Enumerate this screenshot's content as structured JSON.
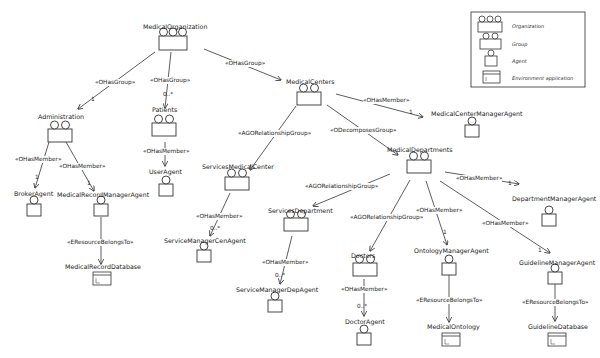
{
  "diagram": {
    "legend": {
      "items": [
        {
          "icon": "organization-icon",
          "label": "Organization"
        },
        {
          "icon": "group-icon",
          "label": "Group"
        },
        {
          "icon": "agent-icon",
          "label": "Agent"
        },
        {
          "icon": "environment-application-icon",
          "label": "Environment application"
        }
      ]
    },
    "nodes": [
      {
        "id": "MedicalOrganization",
        "label": "MedicalOrganization",
        "type": "organization"
      },
      {
        "id": "Administration",
        "label": "Administration",
        "type": "group"
      },
      {
        "id": "Patients",
        "label": "Patients",
        "type": "group"
      },
      {
        "id": "MedicalCenters",
        "label": "MedicalCenters",
        "type": "group"
      },
      {
        "id": "BrokerAgent",
        "label": "BrokerAgent",
        "type": "agent"
      },
      {
        "id": "MedicalRecordManagerAgent",
        "label": "MedicalRecordManagerAgent",
        "type": "agent"
      },
      {
        "id": "UserAgent",
        "label": "UserAgent",
        "type": "agent"
      },
      {
        "id": "MedicalRecordDatabase",
        "label": "MedicalRecordDatabase",
        "type": "environment"
      },
      {
        "id": "MedicalCenterManagerAgent",
        "label": "MedicalCenterManagerAgent",
        "type": "agent"
      },
      {
        "id": "ServicesMedicalCenter",
        "label": "ServicesMedicalCenter",
        "type": "group"
      },
      {
        "id": "ServiceManagerCenAgent",
        "label": "ServiceManagerCenAgent",
        "type": "agent"
      },
      {
        "id": "MedicalDepartments",
        "label": "MedicalDepartments",
        "type": "group"
      },
      {
        "id": "DepartmentManagerAgent",
        "label": "DepartmentManagerAgent",
        "type": "agent"
      },
      {
        "id": "ServicesDepartment",
        "label": "ServicesDepartment",
        "type": "group"
      },
      {
        "id": "ServiceManagerDepAgent",
        "label": "ServiceManagerDepAgent",
        "type": "agent"
      },
      {
        "id": "Doctors",
        "label": "Doctors",
        "type": "group"
      },
      {
        "id": "DoctorAgent",
        "label": "DoctorAgent",
        "type": "agent"
      },
      {
        "id": "OntologyManagerAgent",
        "label": "OntologyManagerAgent",
        "type": "agent"
      },
      {
        "id": "MedicalOntology",
        "label": "MedicalOntology",
        "type": "environment"
      },
      {
        "id": "GuidelineManagerAgent",
        "label": "GuidelineManagerAgent",
        "type": "agent"
      },
      {
        "id": "GuidelineDatabase",
        "label": "GuidelineDatabase",
        "type": "environment"
      }
    ],
    "edges": [
      {
        "from": "MedicalOrganization",
        "to": "Administration",
        "label": "«OHasGroup»",
        "mult": "1"
      },
      {
        "from": "MedicalOrganization",
        "to": "Patients",
        "label": "«OHasGroup»",
        "mult": "0..*"
      },
      {
        "from": "MedicalOrganization",
        "to": "MedicalCenters",
        "label": "«OHasGroup»",
        "mult": ""
      },
      {
        "from": "Administration",
        "to": "BrokerAgent",
        "label": "«OHasMember»",
        "mult": "1"
      },
      {
        "from": "Administration",
        "to": "MedicalRecordManagerAgent",
        "label": "«OHasMember»",
        "mult": "1"
      },
      {
        "from": "Patients",
        "to": "UserAgent",
        "label": "«OHasMember»",
        "mult": ""
      },
      {
        "from": "MedicalRecordManagerAgent",
        "to": "MedicalRecordDatabase",
        "label": "«EResourceBelongsTo»",
        "mult": ""
      },
      {
        "from": "MedicalCenters",
        "to": "MedicalCenterManagerAgent",
        "label": "«OHasMember»",
        "mult": "1"
      },
      {
        "from": "MedicalCenters",
        "to": "ServicesMedicalCenter",
        "label": "«AGORelationshipGroup»",
        "mult": ""
      },
      {
        "from": "MedicalCenters",
        "to": "MedicalDepartments",
        "label": "«ODecomposesGroup»",
        "mult": ""
      },
      {
        "from": "ServicesMedicalCenter",
        "to": "ServiceManagerCenAgent",
        "label": "«OHasMember»",
        "mult": "0..*"
      },
      {
        "from": "MedicalDepartments",
        "to": "DepartmentManagerAgent",
        "label": "«OHasMember»",
        "mult": "1"
      },
      {
        "from": "MedicalDepartments",
        "to": "ServicesDepartment",
        "label": "«AGORelationshipGroup»",
        "mult": ""
      },
      {
        "from": "MedicalDepartments",
        "to": "Doctors",
        "label": "«AGORelationshipGroup»",
        "mult": ""
      },
      {
        "from": "MedicalDepartments",
        "to": "OntologyManagerAgent",
        "label": "«OHasMember»",
        "mult": "1"
      },
      {
        "from": "MedicalDepartments",
        "to": "GuidelineManagerAgent",
        "label": "«OHasMember»",
        "mult": "1"
      },
      {
        "from": "ServicesDepartment",
        "to": "ServiceManagerDepAgent",
        "label": "«OHasMember»",
        "mult": "0..*"
      },
      {
        "from": "Doctors",
        "to": "DoctorAgent",
        "label": "«OHasMember»",
        "mult": "0..*"
      },
      {
        "from": "OntologyManagerAgent",
        "to": "MedicalOntology",
        "label": "«EResourceBelongsTo»",
        "mult": ""
      },
      {
        "from": "GuidelineManagerAgent",
        "to": "GuidelineDatabase",
        "label": "«EResourceBelongsTo»",
        "mult": ""
      }
    ]
  },
  "labels": {
    "MedicalOrganization": "MedicalOrganization",
    "Administration": "Administration",
    "Patients": "Patients",
    "MedicalCenters": "MedicalCenters",
    "BrokerAgent": "BrokerAgent",
    "MedicalRecordManagerAgent": "MedicalRecordManagerAgent",
    "UserAgent": "UserAgent",
    "MedicalRecordDatabase": "MedicalRecordDatabase",
    "MedicalCenterManagerAgent": "MedicalCenterManagerAgent",
    "ServicesMedicalCenter": "ServicesMedicalCenter",
    "ServiceManagerCenAgent": "ServiceManagerCenAgent",
    "MedicalDepartments": "MedicalDepartments",
    "DepartmentManagerAgent": "DepartmentManagerAgent",
    "ServicesDepartment": "ServicesDepartment",
    "ServiceManagerDepAgent": "ServiceManagerDepAgent",
    "Doctors": "Doctors",
    "DoctorAgent": "DoctorAgent",
    "OntologyManagerAgent": "OntologyManagerAgent",
    "MedicalOntology": "MedicalOntology",
    "GuidelineManagerAgent": "GuidelineManagerAgent",
    "GuidelineDatabase": "GuidelineDatabase"
  },
  "stereotypes": {
    "ohasgroup": "«OHasGroup»",
    "ohasmember": "«OHasMember»",
    "agorel": "«AGORelationshipGroup»",
    "odecomposes": "«ODecomposesGroup»",
    "eresource": "«EResourceBelongsTo»"
  },
  "multiplicities": {
    "one": "1",
    "many": "0..*"
  },
  "legend_labels": {
    "organization": "Organization",
    "group": "Group",
    "agent": "Agent",
    "environment": "Environment application"
  }
}
